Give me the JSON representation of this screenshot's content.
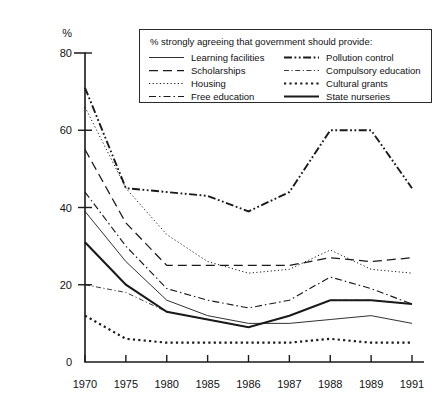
{
  "chart_data": {
    "type": "line",
    "title": "",
    "legend_title": "% strongly agreeing that government should provide:",
    "legend_position": "top-right-inside",
    "xlabel": "",
    "ylabel": "%",
    "ylim": [
      0,
      80
    ],
    "yticks": [
      0,
      20,
      40,
      60,
      80
    ],
    "grid": false,
    "categories": [
      "1970",
      "1975",
      "1980",
      "1985",
      "1986",
      "1987",
      "1988",
      "1989",
      "1991"
    ],
    "series": [
      {
        "name": "Learning facilities",
        "style": "solid-thin",
        "values": [
          39,
          26,
          16,
          12,
          10,
          10,
          11,
          12,
          10
        ]
      },
      {
        "name": "Scholarships",
        "style": "dashed",
        "values": [
          55,
          36,
          25,
          25,
          25,
          25,
          27,
          26,
          27
        ]
      },
      {
        "name": "Housing",
        "style": "dotted-fine",
        "values": [
          66,
          45,
          33,
          26,
          23,
          24,
          29,
          24,
          23
        ]
      },
      {
        "name": "Free education",
        "style": "dash-dot",
        "values": [
          44,
          30,
          19,
          16,
          14,
          16,
          22,
          19,
          15
        ]
      },
      {
        "name": "Pollution control",
        "style": "dash-dot-dot",
        "values": [
          71,
          45,
          44,
          43,
          39,
          44,
          60,
          60,
          45
        ]
      },
      {
        "name": "Compulsory education",
        "style": "dash-dot-thin",
        "values": [
          20,
          18,
          13,
          11,
          9,
          12,
          16,
          16,
          15
        ]
      },
      {
        "name": "Cultural grants",
        "style": "dotted-thick",
        "values": [
          12,
          6,
          5,
          5,
          5,
          5,
          6,
          5,
          5
        ]
      },
      {
        "name": "State nurseries",
        "style": "solid-thick",
        "values": [
          31,
          20,
          13,
          11,
          9,
          12,
          16,
          16,
          15
        ]
      }
    ]
  },
  "axes": {
    "y_unit_label": "%",
    "y_tick_labels": [
      "0",
      "20",
      "40",
      "60",
      "80"
    ],
    "x_tick_labels": [
      "1970",
      "1975",
      "1980",
      "1985",
      "1986",
      "1987",
      "1988",
      "1989",
      "1991"
    ]
  },
  "legend": {
    "title": "% strongly agreeing that government should provide:",
    "left_column": [
      {
        "label": "Learning facilities",
        "style": "solid-thin"
      },
      {
        "label": "Scholarships",
        "style": "dashed"
      },
      {
        "label": "Housing",
        "style": "dotted-fine"
      },
      {
        "label": "Free education",
        "style": "dash-dot"
      }
    ],
    "right_column": [
      {
        "label": "Pollution control",
        "style": "dash-dot-dot"
      },
      {
        "label": "Compulsory education",
        "style": "dash-dot-thin"
      },
      {
        "label": "Cultural grants",
        "style": "dotted-thick"
      },
      {
        "label": "State nurseries",
        "style": "solid-thick"
      }
    ]
  },
  "colors": {
    "ink": "#1a1a1a",
    "background": "#ffffff"
  }
}
